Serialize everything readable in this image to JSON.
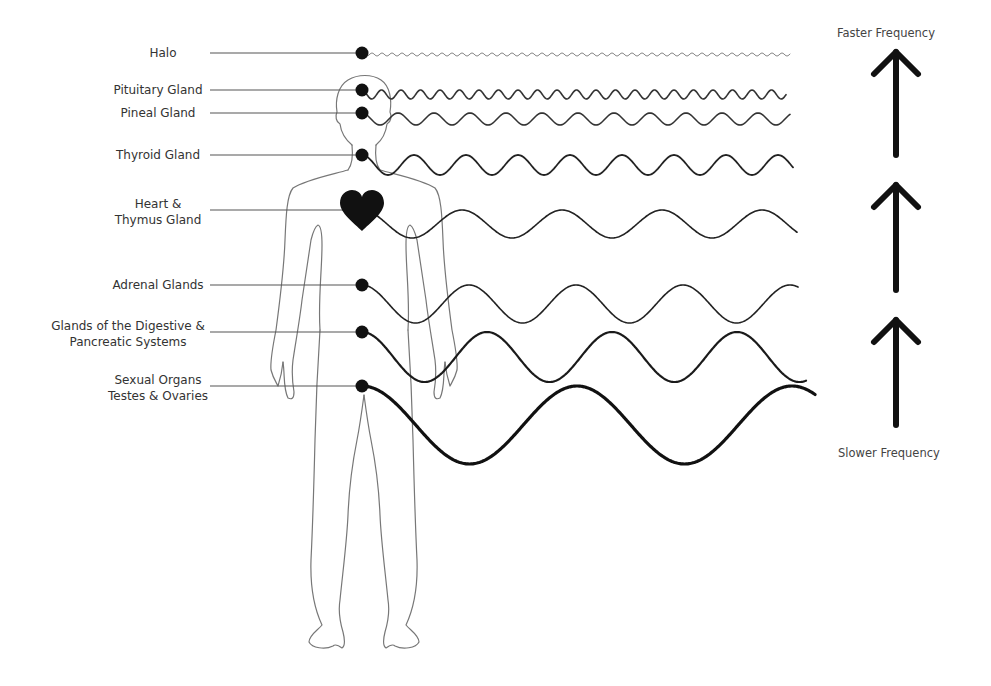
{
  "diagram": {
    "frequency_labels": {
      "top": "Faster Frequency",
      "bottom": "Slower Frequency"
    },
    "glands": [
      {
        "label_lines": [
          "Halo"
        ],
        "y": 53,
        "amplitude": 1.5,
        "period": 10,
        "stroke": 1.0,
        "color": "#888888",
        "end_x": 790
      },
      {
        "label_lines": [
          "Pituitary Gland"
        ],
        "y": 90,
        "amplitude": 4.5,
        "period": 19.5,
        "stroke": 1.6,
        "color": "#333333",
        "end_x": 786
      },
      {
        "label_lines": [
          "Pineal Gland"
        ],
        "y": 113,
        "amplitude": 6,
        "period": 36,
        "stroke": 1.6,
        "color": "#333333",
        "end_x": 790
      },
      {
        "label_lines": [
          "Thyroid Gland"
        ],
        "y": 155,
        "amplitude": 10,
        "period": 52,
        "stroke": 1.8,
        "color": "#222222",
        "end_x": 793
      },
      {
        "label_lines": [
          "Heart &",
          "Thymus Gland"
        ],
        "y": 210,
        "amplitude": 14,
        "period": 100,
        "stroke": 1.6,
        "color": "#222222",
        "end_x": 797,
        "marker": "heart"
      },
      {
        "label_lines": [
          "Adrenal Glands"
        ],
        "y": 285,
        "amplitude": 19,
        "period": 107,
        "stroke": 1.6,
        "color": "#222222",
        "end_x": 798
      },
      {
        "label_lines": [
          "Glands of the Digestive &",
          "Pancreatic Systems"
        ],
        "y": 332,
        "amplitude": 25,
        "period": 125,
        "stroke": 2.2,
        "color": "#1a1a1a",
        "end_x": 806
      },
      {
        "label_lines": [
          "Sexual Organs",
          "Testes & Ovaries"
        ],
        "y": 386,
        "amplitude": 39,
        "period": 215,
        "stroke": 3.2,
        "color": "#111111",
        "end_x": 815
      }
    ],
    "arrows": [
      {
        "name": "top",
        "y_top": 50,
        "y_bottom": 155
      },
      {
        "name": "middle",
        "y_top": 183,
        "y_bottom": 290
      },
      {
        "name": "bottom",
        "y_top": 318,
        "y_bottom": 425
      }
    ]
  }
}
